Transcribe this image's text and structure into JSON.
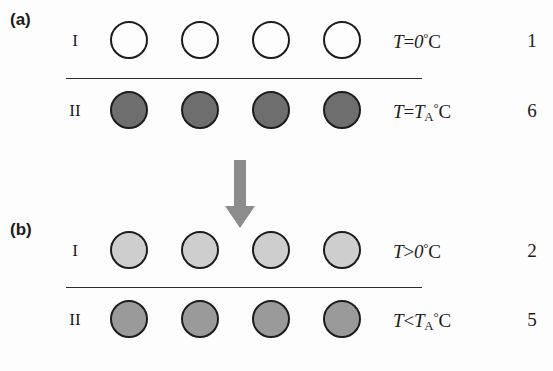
{
  "figure": {
    "panels": [
      {
        "label": "(a)",
        "rows": [
          {
            "roman": "I",
            "circle_count": 4,
            "circle_fill": "#ffffff",
            "circle_stroke": "#1c1c1c",
            "condition": {
              "variable": "T",
              "operator": "=",
              "value": "0",
              "value_sub": "",
              "degree": "°",
              "unit": "C",
              "plain": "T=0°C"
            },
            "index": "1"
          },
          {
            "roman": "II",
            "circle_count": 4,
            "circle_fill": "#6e6e6e",
            "circle_stroke": "#1c1c1c",
            "condition": {
              "variable": "T",
              "operator": "=",
              "value": "T",
              "value_sub": "A",
              "degree": "°",
              "unit": "C",
              "plain": "T=T_A°C"
            },
            "index": "6"
          }
        ]
      },
      {
        "label": "(b)",
        "rows": [
          {
            "roman": "I",
            "circle_count": 4,
            "circle_fill": "#cecece",
            "circle_stroke": "#1c1c1c",
            "condition": {
              "variable": "T",
              "operator": ">",
              "value": "0",
              "value_sub": "",
              "degree": "°",
              "unit": "C",
              "plain": "T>0°C"
            },
            "index": "2"
          },
          {
            "roman": "II",
            "circle_count": 4,
            "circle_fill": "#9a9a9a",
            "circle_stroke": "#1c1c1c",
            "condition": {
              "variable": "T",
              "operator": "<",
              "value": "T",
              "value_sub": "A",
              "degree": "°",
              "unit": "C",
              "plain": "T<T_A°C"
            },
            "index": "5"
          }
        ]
      }
    ],
    "arrow": {
      "name": "downward-transition-arrow",
      "direction": "down",
      "color": "#8c8c8c"
    },
    "dividers": 2
  }
}
